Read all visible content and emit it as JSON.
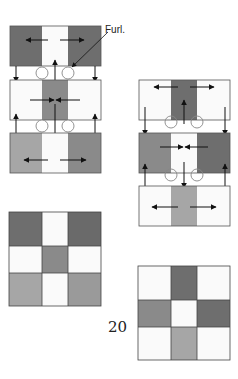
{
  "labels": {
    "furl": "Furl.",
    "page_number": "20"
  },
  "colors": {
    "dark": "#6e6e6e",
    "medium": "#8a8a8a",
    "light": "#a6a6a6",
    "white": "#fafafa",
    "stroke": "#444444",
    "circle": "#888888",
    "arrow": "#111111"
  },
  "diagrams": {
    "left_stack": {
      "rows": [
        {
          "cells": [
            "dark",
            "white",
            "dark"
          ],
          "arrows": "outward"
        },
        {
          "cells": [
            "white",
            "medium",
            "white"
          ],
          "arrows": "inward"
        },
        {
          "cells": [
            "light",
            "white",
            "light"
          ],
          "arrows": "outward"
        }
      ]
    },
    "right_stack": {
      "rows": [
        {
          "cells": [
            "white",
            "dark",
            "white"
          ],
          "arrows": "outward"
        },
        {
          "cells": [
            "medium",
            "white",
            "dark"
          ],
          "arrows": "inward"
        },
        {
          "cells": [
            "white",
            "light",
            "white"
          ],
          "arrows": "outward"
        }
      ]
    },
    "left_grid": {
      "cells": [
        [
          "dark",
          "white",
          "dark"
        ],
        [
          "white",
          "medium",
          "white"
        ],
        [
          "light",
          "white",
          "light"
        ]
      ]
    },
    "right_grid": {
      "cells": [
        [
          "white",
          "dark",
          "white"
        ],
        [
          "medium",
          "white",
          "dark"
        ],
        [
          "white",
          "light",
          "white"
        ]
      ]
    }
  }
}
